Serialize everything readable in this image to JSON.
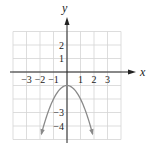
{
  "chart_data": {
    "type": "line",
    "title": "",
    "xlabel": "x",
    "ylabel": "y",
    "xlim": [
      -4,
      4
    ],
    "ylim": [
      -5,
      3
    ],
    "grid": true,
    "x_tick_labels": [
      "-3",
      "-2",
      "-1",
      "1",
      "2",
      "3"
    ],
    "y_tick_labels": [
      "2",
      "1",
      "-3",
      "-4"
    ],
    "series": [
      {
        "name": "parabola",
        "equation": "y = -x^2 - 1",
        "vertex": [
          0,
          -1
        ],
        "x": [
          -1.9,
          -1.5,
          -1,
          -0.5,
          0,
          0.5,
          1,
          1.5,
          1.9
        ],
        "y": [
          -4.61,
          -3.25,
          -2,
          -1.25,
          -1,
          -1.25,
          -2,
          -3.25,
          -4.61
        ],
        "color": "#8a8a8a",
        "arrows_at_ends": true
      }
    ]
  },
  "labels": {
    "x_axis": "x",
    "y_axis": "y",
    "x_ticks": [
      "−3",
      "−2",
      "−1",
      "1",
      "2",
      "3"
    ],
    "y_ticks": [
      "2",
      "1",
      "−3",
      "−4"
    ]
  }
}
